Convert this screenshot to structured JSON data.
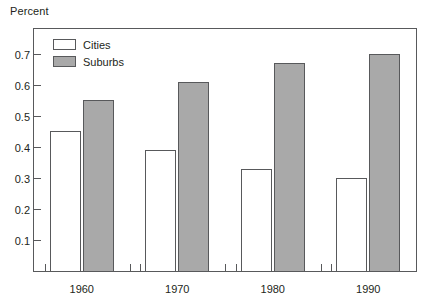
{
  "axis": {
    "ylabel_top": "Percent",
    "ytick_labels": [
      "0.1",
      "0.2",
      "0.3",
      "0.4",
      "0.5",
      "0.6",
      "0.7"
    ],
    "xtick_labels": [
      "1960",
      "1970",
      "1980",
      "1990"
    ]
  },
  "legend": {
    "items": [
      {
        "label": "Cities",
        "swatch": "white-outlined-swatch",
        "color": "#ffffff"
      },
      {
        "label": "Suburbs",
        "swatch": "gray-filled-swatch",
        "color": "#a9a9a9"
      }
    ]
  },
  "colors": {
    "cities_fill": "#ffffff",
    "suburbs_fill": "#a9a9a9",
    "line": "#58595b",
    "text": "#231f20",
    "background": "#ffffff"
  },
  "chart_data": {
    "type": "bar",
    "title": "",
    "xlabel": "",
    "ylabel": "Percent",
    "categories": [
      "1960",
      "1970",
      "1980",
      "1990"
    ],
    "series": [
      {
        "name": "Cities",
        "values": [
          0.45,
          0.39,
          0.33,
          0.3
        ],
        "color": "#ffffff"
      },
      {
        "name": "Suburbs",
        "values": [
          0.55,
          0.61,
          0.67,
          0.7
        ],
        "color": "#a9a9a9"
      }
    ],
    "ylim": [
      0,
      0.78
    ],
    "yticks": [
      0.1,
      0.2,
      0.3,
      0.4,
      0.5,
      0.6,
      0.7
    ],
    "grid": false,
    "legend_position": "top-left"
  }
}
